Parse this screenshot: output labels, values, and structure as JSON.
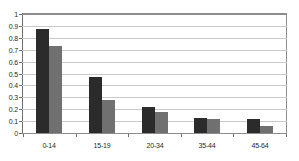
{
  "chart_data": {
    "type": "bar",
    "title": "",
    "subtitle": "",
    "xlabel": "",
    "ylabel": "",
    "categories": [
      "0-14",
      "15-19",
      "20-34",
      "35-44",
      "45-64"
    ],
    "series": [
      {
        "name": "series-1",
        "color": "#2b2b2b",
        "values": [
          0.87,
          0.47,
          0.215,
          0.13,
          0.12
        ]
      },
      {
        "name": "series-2",
        "color": "#707070",
        "values": [
          0.73,
          0.28,
          0.18,
          0.12,
          0.06
        ]
      }
    ],
    "ylim": [
      0,
      1
    ],
    "ytick_labels": [
      "1",
      "0.9",
      "0.8",
      "0.7",
      "0.6",
      "0.5",
      "0.4",
      "0.3",
      "0.2",
      "0.1",
      "0"
    ],
    "ytick_values": [
      1,
      0.9,
      0.8,
      0.7,
      0.6,
      0.5,
      0.4,
      0.3,
      0.2,
      0.1,
      0
    ],
    "grid": true,
    "grid_axis": "y",
    "legend": false,
    "legend_position": "none",
    "annotations": []
  },
  "style": {
    "plot_border_color": "#8d8d8d",
    "gridline_color": "#c9c9c9",
    "axis_color": "#6e6e6e",
    "background_color": "#ffffff",
    "tick_text_color": "#2a2a2a"
  }
}
